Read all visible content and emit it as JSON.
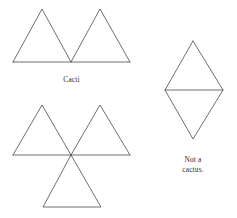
{
  "canvas": {
    "width": 237,
    "height": 218,
    "background": "#ffffff",
    "stroke_color": "#4a4a4a",
    "stroke_width": 0.8
  },
  "labels": {
    "cacti": "Cacti",
    "not_a_cactus_line1": "Not a",
    "not_a_cactus_line2": "cactus."
  },
  "figures": {
    "cacti_top": {
      "name": "two-adjacent-triangles",
      "description": "Two upward triangles sharing a single baseline, touching at one bottom vertex",
      "polylines": [
        "13,62 42,9 71,62",
        "71,62 100,9 130,62",
        "13,62 130,62"
      ]
    },
    "cacti_bottom": {
      "name": "three-triangles-meeting-at-a-point",
      "description": "Two upward triangles on a shared baseline plus one downward triangle, all meeting at a single central vertex",
      "polylines": [
        "13,155 42,105 71,155",
        "71,155 100,105 130,155",
        "13,155 130,155",
        "71,155 43,207 101,207 71,155"
      ]
    },
    "not_a_cactus": {
      "name": "rhombus-with-horizontal-chord",
      "description": "A rhombus (two triangles sharing a full edge) with a horizontal line through the middle",
      "polylines": [
        "193,41 165,90 193,139 223,90 193,41",
        "165,90 223,90"
      ]
    }
  }
}
